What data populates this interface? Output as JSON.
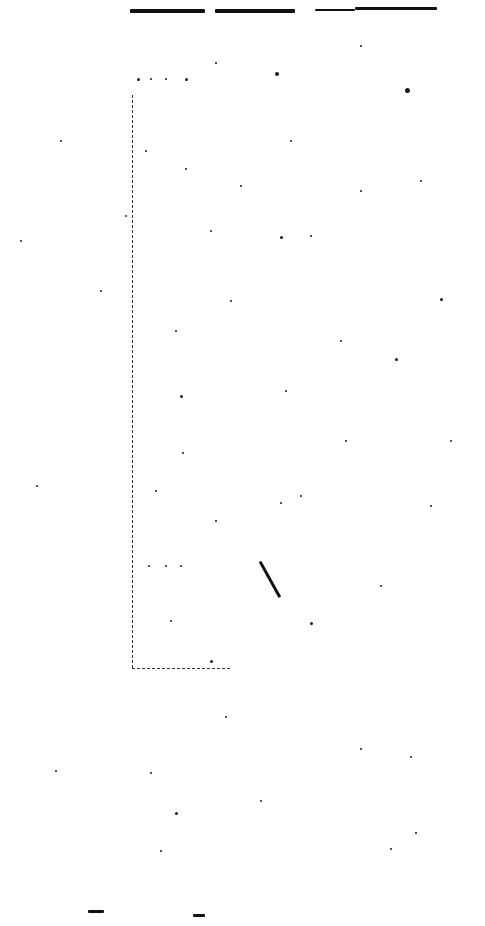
{
  "page": {
    "background": "#ffffff",
    "ink": "#111111"
  },
  "marks": {
    "top_strokes": [
      {
        "x": 130,
        "y": 9,
        "w": 75,
        "h": 4
      },
      {
        "x": 215,
        "y": 9,
        "w": 80,
        "h": 4
      },
      {
        "x": 315,
        "y": 9,
        "w": 40,
        "h": 2
      },
      {
        "x": 355,
        "y": 7,
        "w": 82,
        "h": 3
      }
    ],
    "frame": {
      "left_x": 132,
      "top_y": 95,
      "bottom_y": 668,
      "right_x": 230
    },
    "diagonal": {
      "x1": 260,
      "y1": 560,
      "x2": 280,
      "y2": 596
    },
    "bottom_strokes": [
      {
        "x": 88,
        "y": 910,
        "w": 16,
        "h": 3
      },
      {
        "x": 193,
        "y": 914,
        "w": 12,
        "h": 3
      }
    ],
    "specks": [
      [
        275,
        72,
        4
      ],
      [
        405,
        88,
        5
      ],
      [
        215,
        62,
        2
      ],
      [
        360,
        45,
        2
      ],
      [
        137,
        78,
        3
      ],
      [
        150,
        78,
        2
      ],
      [
        165,
        78,
        2
      ],
      [
        185,
        78,
        3
      ],
      [
        145,
        150,
        2
      ],
      [
        185,
        168,
        2
      ],
      [
        290,
        140,
        2
      ],
      [
        240,
        185,
        2
      ],
      [
        280,
        236,
        3
      ],
      [
        310,
        235,
        2
      ],
      [
        360,
        190,
        2
      ],
      [
        420,
        180,
        2
      ],
      [
        440,
        298,
        3
      ],
      [
        340,
        340,
        2
      ],
      [
        395,
        358,
        3
      ],
      [
        180,
        395,
        3
      ],
      [
        285,
        390,
        2
      ],
      [
        182,
        452,
        2
      ],
      [
        345,
        440,
        2
      ],
      [
        300,
        495,
        2
      ],
      [
        280,
        502,
        2
      ],
      [
        155,
        490,
        2
      ],
      [
        215,
        520,
        2
      ],
      [
        310,
        622,
        3
      ],
      [
        170,
        620,
        2
      ],
      [
        210,
        660,
        3
      ],
      [
        225,
        716,
        2
      ],
      [
        360,
        748,
        2
      ],
      [
        410,
        756,
        2
      ],
      [
        150,
        772,
        2
      ],
      [
        175,
        812,
        3
      ],
      [
        260,
        800,
        2
      ],
      [
        160,
        850,
        2
      ],
      [
        415,
        832,
        2
      ],
      [
        390,
        848,
        2
      ],
      [
        55,
        770,
        2
      ],
      [
        100,
        290,
        2
      ],
      [
        60,
        140,
        2
      ],
      [
        20,
        240,
        2
      ],
      [
        36,
        485,
        2
      ],
      [
        450,
        440,
        2
      ],
      [
        380,
        585,
        2
      ],
      [
        430,
        505,
        2
      ],
      [
        125,
        215,
        2
      ],
      [
        148,
        565,
        2
      ],
      [
        165,
        565,
        2
      ],
      [
        180,
        565,
        2
      ],
      [
        175,
        330,
        2
      ],
      [
        230,
        300,
        2
      ],
      [
        210,
        230,
        2
      ]
    ]
  }
}
